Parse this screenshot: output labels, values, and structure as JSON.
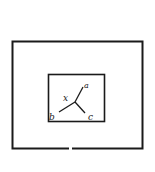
{
  "diagram": {
    "type": "nested-rectangles-with-junction",
    "outer_box": {
      "x": 12,
      "y": 41,
      "width": 131,
      "height": 108,
      "stroke": "#1a1a1a"
    },
    "inner_box": {
      "x": 48,
      "y": 74,
      "width": 57,
      "height": 48,
      "stroke": "#1a1a1a"
    },
    "junction": {
      "x": 75,
      "y": 102
    },
    "branches": [
      {
        "id": "a",
        "to": {
          "x": 83,
          "y": 87
        }
      },
      {
        "id": "c",
        "to": {
          "x": 86,
          "y": 114
        }
      },
      {
        "id": "b",
        "to": {
          "x": 58,
          "y": 112
        }
      }
    ],
    "labels": {
      "junction": "x",
      "top_right": "a",
      "bottom_right": "c",
      "bottom_left": "b"
    },
    "colors": {
      "ink": "#1a1a1a",
      "background": "#ffffff"
    }
  }
}
